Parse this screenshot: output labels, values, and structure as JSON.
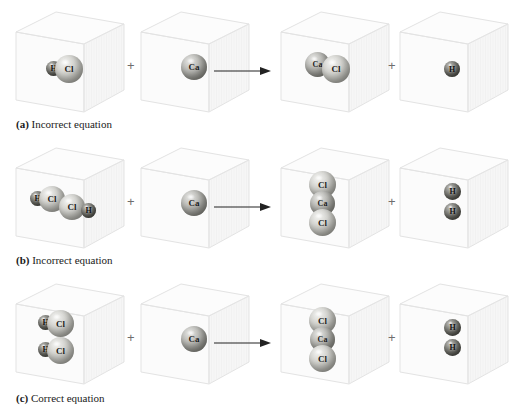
{
  "figure": {
    "operators": {
      "plus": "+",
      "arrow": "→"
    },
    "atom_colors": {
      "chlorine": "#b7b7b2",
      "calcium": "#9d9d98",
      "hydrogen": "#6c6c66",
      "box_line": "#e3e3e3",
      "text": "#1a1a1a"
    },
    "symbols": {
      "hydrogen": "H",
      "chlorine": "Cl",
      "calcium": "Ca"
    }
  },
  "rows": [
    {
      "id": "a",
      "caption_tag": "(a)",
      "caption_text": "Incorrect equation",
      "boxes": [
        {
          "name": "reactant-hcl",
          "atoms": [
            {
              "symbol": "H",
              "kind": "h",
              "x": 32,
              "y": 51,
              "d": 15,
              "fs": 8
            },
            {
              "symbol": "Cl",
              "kind": "cl",
              "x": 41,
              "y": 45,
              "d": 28,
              "fs": 9
            }
          ]
        },
        {
          "name": "reactant-ca",
          "atoms": [
            {
              "symbol": "Ca",
              "kind": "ca",
              "x": 42,
              "y": 44,
              "d": 26,
              "fs": 9
            }
          ]
        },
        {
          "name": "product-cacl",
          "atoms": [
            {
              "symbol": "Ca",
              "kind": "ca",
              "x": 26,
              "y": 42,
              "d": 25,
              "fs": 8
            },
            {
              "symbol": "Cl",
              "kind": "cl",
              "x": 43,
              "y": 45,
              "d": 28,
              "fs": 9
            }
          ]
        },
        {
          "name": "product-h",
          "atoms": [
            {
              "symbol": "H",
              "kind": "h",
              "x": 46,
              "y": 51,
              "d": 16,
              "fs": 8
            }
          ]
        }
      ]
    },
    {
      "id": "b",
      "caption_tag": "(b)",
      "caption_text": "Incorrect equation",
      "boxes": [
        {
          "name": "reactant-hcl-hcl",
          "atoms": [
            {
              "symbol": "H",
              "kind": "h",
              "x": 16,
              "y": 45,
              "d": 15,
              "fs": 8
            },
            {
              "symbol": "Cl",
              "kind": "cl",
              "x": 25,
              "y": 40,
              "d": 26,
              "fs": 9
            },
            {
              "symbol": "Cl",
              "kind": "cl",
              "x": 45,
              "y": 48,
              "d": 26,
              "fs": 9
            },
            {
              "symbol": "H",
              "kind": "h",
              "x": 67,
              "y": 57,
              "d": 15,
              "fs": 8
            }
          ]
        },
        {
          "name": "reactant-ca",
          "atoms": [
            {
              "symbol": "Ca",
              "kind": "ca",
              "x": 42,
              "y": 44,
              "d": 26,
              "fs": 9
            }
          ]
        },
        {
          "name": "product-cacl2",
          "atoms": [
            {
              "symbol": "Cl",
              "kind": "cl",
              "x": 30,
              "y": 25,
              "d": 27,
              "fs": 9
            },
            {
              "symbol": "Ca",
              "kind": "ca",
              "x": 31,
              "y": 45,
              "d": 25,
              "fs": 8
            },
            {
              "symbol": "Cl",
              "kind": "cl",
              "x": 30,
              "y": 63,
              "d": 27,
              "fs": 9
            }
          ]
        },
        {
          "name": "product-h2",
          "atoms": [
            {
              "symbol": "H",
              "kind": "h",
              "x": 46,
              "y": 37,
              "d": 17,
              "fs": 8
            },
            {
              "symbol": "H",
              "kind": "h",
              "x": 46,
              "y": 57,
              "d": 17,
              "fs": 8
            }
          ]
        }
      ]
    },
    {
      "id": "c",
      "caption_tag": "(c)",
      "caption_text": "Correct equation",
      "boxes": [
        {
          "name": "reactant-2hcl",
          "atoms": [
            {
              "symbol": "H",
              "kind": "h",
              "x": 24,
              "y": 33,
              "d": 15,
              "fs": 8
            },
            {
              "symbol": "Cl",
              "kind": "cl",
              "x": 33,
              "y": 28,
              "d": 27,
              "fs": 9
            },
            {
              "symbol": "H",
              "kind": "h",
              "x": 24,
              "y": 60,
              "d": 15,
              "fs": 8
            },
            {
              "symbol": "Cl",
              "kind": "cl",
              "x": 33,
              "y": 55,
              "d": 27,
              "fs": 9
            }
          ]
        },
        {
          "name": "reactant-ca",
          "atoms": [
            {
              "symbol": "Ca",
              "kind": "ca",
              "x": 42,
              "y": 44,
              "d": 26,
              "fs": 9
            }
          ]
        },
        {
          "name": "product-cacl2",
          "atoms": [
            {
              "symbol": "Cl",
              "kind": "cl",
              "x": 30,
              "y": 25,
              "d": 27,
              "fs": 9
            },
            {
              "symbol": "Ca",
              "kind": "ca",
              "x": 31,
              "y": 45,
              "d": 25,
              "fs": 8
            },
            {
              "symbol": "Cl",
              "kind": "cl",
              "x": 30,
              "y": 63,
              "d": 27,
              "fs": 9
            }
          ]
        },
        {
          "name": "product-h2",
          "atoms": [
            {
              "symbol": "H",
              "kind": "h",
              "x": 46,
              "y": 37,
              "d": 17,
              "fs": 8
            },
            {
              "symbol": "H",
              "kind": "h",
              "x": 46,
              "y": 57,
              "d": 17,
              "fs": 8
            }
          ]
        }
      ]
    }
  ]
}
